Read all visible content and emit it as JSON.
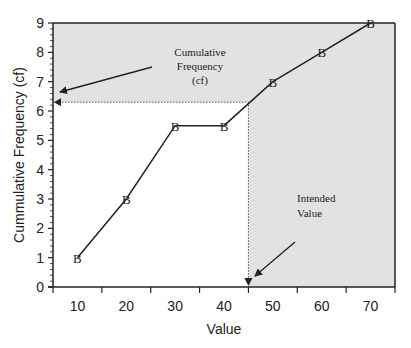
{
  "chart_data": {
    "type": "line",
    "title": "",
    "xlabel": "Value",
    "ylabel": "Cummulative Frequency (cf)",
    "x": [
      10,
      20,
      30,
      40,
      50,
      60,
      70
    ],
    "series": [
      {
        "name": "cf",
        "marker": "B",
        "values": [
          1,
          3,
          5.5,
          5.5,
          7,
          8,
          9
        ]
      }
    ],
    "xticks": [
      10,
      20,
      30,
      40,
      50,
      60,
      70
    ],
    "yticks": [
      0,
      1,
      2,
      3,
      4,
      5,
      6,
      7,
      8,
      9
    ],
    "xlim": [
      5,
      75
    ],
    "ylim": [
      0,
      9
    ],
    "grid": false,
    "legend": null,
    "reference": {
      "intended_value_x": 45,
      "cf_y": 6.3
    },
    "shaded_region": "outside the rectangle x<45, cf<6.3",
    "annotations": [
      {
        "text": "Cumulative Frequency (cf)",
        "points_to": "y-axis at cf≈6.3"
      },
      {
        "text": "Intended Value",
        "points_to": "x-axis at value≈45"
      }
    ]
  },
  "labels": {
    "xlabel": "Value",
    "ylabel": "Cummulative Frequency (cf)",
    "annot_cf_line1": "Cumulative",
    "annot_cf_line2": "Frequency",
    "annot_cf_line3": "(cf)",
    "annot_iv_line1": "Intended",
    "annot_iv_line2": "Value",
    "marker": "B"
  },
  "colors": {
    "shade": "#e2e2e2",
    "ink": "#222222",
    "background": "#ffffff"
  }
}
